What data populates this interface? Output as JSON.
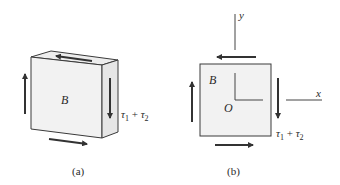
{
  "figure": {
    "panel_a": {
      "caption": "(a)",
      "body_label": "B",
      "shear_label": {
        "tau": "τ",
        "sub1": "1",
        "plus": " + ",
        "sub2": "2"
      }
    },
    "panel_b": {
      "caption": "(b)",
      "body_label": "B",
      "origin_label": "O",
      "x_axis_label": "x",
      "y_axis_label": "y",
      "shear_label": {
        "tau": "τ",
        "sub1": "1",
        "plus": " + ",
        "sub2": "2"
      }
    },
    "colors": {
      "block_face": "#f2f2f2",
      "block_side": "#e6e6e6",
      "block_top": "#ededed",
      "stroke": "#3a3a3a",
      "arrow": "#333333"
    }
  }
}
